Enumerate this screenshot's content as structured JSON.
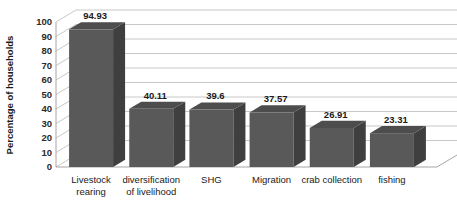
{
  "chart_data": {
    "type": "bar",
    "title": "",
    "subtitle": "",
    "xlabel": "",
    "ylabel": "Percentage of households",
    "categories": [
      "Livestock rearing",
      "diversification of livelihood",
      "SHG",
      "Migration",
      "crab collection",
      "fishing"
    ],
    "category_lines": [
      [
        "Livestock",
        "rearing"
      ],
      [
        "diversification",
        "of livelihood"
      ],
      [
        "SHG"
      ],
      [
        "Migration"
      ],
      [
        "crab collection"
      ],
      [
        "fishing"
      ]
    ],
    "values": [
      94.93,
      40.11,
      39.6,
      37.57,
      26.91,
      23.31
    ],
    "data_labels": [
      "94.93",
      "40.11",
      "39.6",
      "37.57",
      "26.91",
      "23.31"
    ],
    "ylim": [
      0,
      100
    ],
    "ytick_step": 10,
    "ytick_labels": [
      "0",
      "10",
      "20",
      "30",
      "40",
      "50",
      "60",
      "70",
      "80",
      "90",
      "100"
    ],
    "grid": true,
    "grid_axis": "y",
    "legend": false,
    "legend_position": "none",
    "style": "3d-column",
    "colors": {
      "bar_front": "#595959",
      "bar_side": "#3f3f3f",
      "bar_top": "#4d4d4d",
      "gridline": "#c8c8c8",
      "axis_line": "#a6a6a6",
      "floor": "#ffffff",
      "background": "#ffffff",
      "text": "#1a1a1a"
    }
  }
}
